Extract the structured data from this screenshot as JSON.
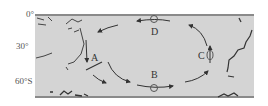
{
  "latitude_labels": [
    "0°",
    "30°",
    "60°S"
  ],
  "current_labels": {
    "A": "A",
    "B": "B",
    "C": "C",
    "D": "D"
  },
  "colors": {
    "ocean": "#d4d4d4",
    "frame": "#8a8a8a",
    "lines": "#333333"
  }
}
